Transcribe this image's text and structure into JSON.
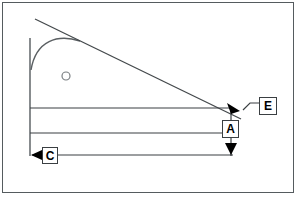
{
  "figure": {
    "background_color": "#ffffff",
    "frame_color": "#555b5e",
    "stroke_color": "#000000",
    "line_color": "#3a3f42",
    "curve_color": "#4a4f52",
    "width": 298,
    "height": 197
  },
  "labels": [
    {
      "id": "label-e",
      "text": "E",
      "x": 259,
      "y": 97,
      "w": 18,
      "h": 18
    },
    {
      "id": "label-a",
      "text": "A",
      "x": 222,
      "y": 120,
      "w": 17,
      "h": 18
    },
    {
      "id": "label-c",
      "text": "C",
      "x": 42,
      "y": 147,
      "w": 16,
      "h": 17
    }
  ],
  "geometry": {
    "vertical_axis": {
      "x": 30,
      "y1": 38,
      "y2": 156
    },
    "diagonal_line": {
      "x1": 35,
      "y1": 19,
      "x2": 241,
      "y2": 119
    },
    "curve": {
      "type": "arc",
      "start": [
        31,
        69
      ],
      "control1": [
        38,
        36
      ],
      "control2": [
        60,
        36
      ],
      "end": [
        80,
        41
      ]
    },
    "circle_marker": {
      "cx": 66,
      "cy": 76,
      "r": 4
    },
    "horizontal_lines": [
      {
        "id": "line-top",
        "x1": 30,
        "y1": 108,
        "x2": 231,
        "y2": 108
      },
      {
        "id": "line-middle",
        "x1": 30,
        "y1": 133,
        "x2": 222,
        "y2": 133
      },
      {
        "id": "line-bottom",
        "x1": 34,
        "y1": 155,
        "x2": 231,
        "y2": 155
      }
    ],
    "vertical_connectors": [
      {
        "id": "connector-a-top",
        "x": 231,
        "y1": 108,
        "y2": 120
      },
      {
        "id": "connector-a-bot",
        "x": 231,
        "y1": 138,
        "y2": 155
      }
    ],
    "leader_e": {
      "points": "259,103 248,103 241,110"
    },
    "arrowheads": [
      {
        "id": "arrow-e",
        "direction": "down-left",
        "tip_x": 241,
        "tip_y": 110
      },
      {
        "id": "arrow-a",
        "direction": "down",
        "tip_x": 231,
        "tip_y": 155
      },
      {
        "id": "arrow-c",
        "direction": "left",
        "tip_x": 31,
        "tip_y": 155
      }
    ]
  }
}
